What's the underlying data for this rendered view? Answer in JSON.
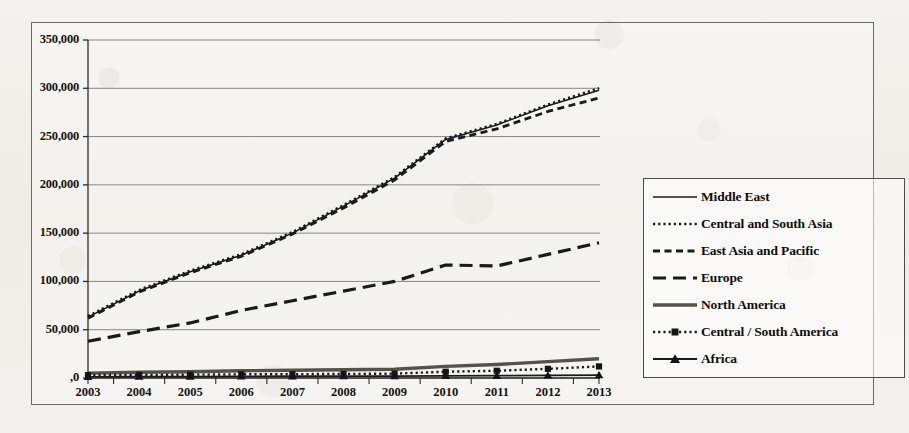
{
  "chart_data": {
    "type": "line",
    "title": "",
    "xlabel": "",
    "ylabel": "",
    "categories": [
      "2003",
      "2004",
      "2005",
      "2006",
      "2007",
      "2008",
      "2009",
      "2010",
      "2011",
      "2012",
      "2013"
    ],
    "ylim": [
      0,
      350000
    ],
    "yticks": [
      0,
      50000,
      100000,
      150000,
      200000,
      250000,
      300000,
      350000
    ],
    "ytick_labels": [
      ",0",
      "50,000",
      "100,000",
      "150,000",
      "200,000",
      "250,000",
      "300,000",
      "350,000"
    ],
    "grid": true,
    "legend_position": "right",
    "series": [
      {
        "name": "Middle East",
        "style": "solid-thin",
        "color": "#1a1a1a",
        "values": [
          63000,
          90000,
          110000,
          127000,
          150000,
          178000,
          207000,
          247000,
          262000,
          282000,
          298000
        ]
      },
      {
        "name": "Central and South Asia",
        "style": "dotted",
        "color": "#1a1a1a",
        "values": [
          64000,
          91000,
          111000,
          128000,
          151000,
          179000,
          208000,
          248000,
          263000,
          283000,
          300000
        ]
      },
      {
        "name": "East Asia and Pacific",
        "style": "dashed-short",
        "color": "#1a1a1a",
        "values": [
          62000,
          89000,
          109000,
          126000,
          149000,
          176000,
          205000,
          245000,
          258000,
          276000,
          290000
        ]
      },
      {
        "name": "Europe",
        "style": "dashed-long",
        "color": "#1a1a1a",
        "values": [
          38000,
          48000,
          57000,
          70000,
          80000,
          90000,
          100000,
          117000,
          116000,
          128000,
          140000
        ]
      },
      {
        "name": "North America",
        "style": "solid-thick-grey",
        "color": "#55524d",
        "values": [
          5000,
          6000,
          6500,
          7500,
          8000,
          8500,
          9000,
          12000,
          14000,
          17000,
          20000
        ]
      },
      {
        "name": "Central / South America",
        "style": "dotted-square",
        "color": "#1a1a1a",
        "values": [
          3000,
          3200,
          3400,
          3800,
          4000,
          4200,
          4500,
          6500,
          7500,
          9500,
          12000
        ]
      },
      {
        "name": "Africa",
        "style": "solid-triangle",
        "color": "#1a1a1a",
        "values": [
          1200,
          1400,
          1500,
          1700,
          1800,
          1900,
          2000,
          2200,
          2400,
          2700,
          3000
        ]
      }
    ]
  }
}
